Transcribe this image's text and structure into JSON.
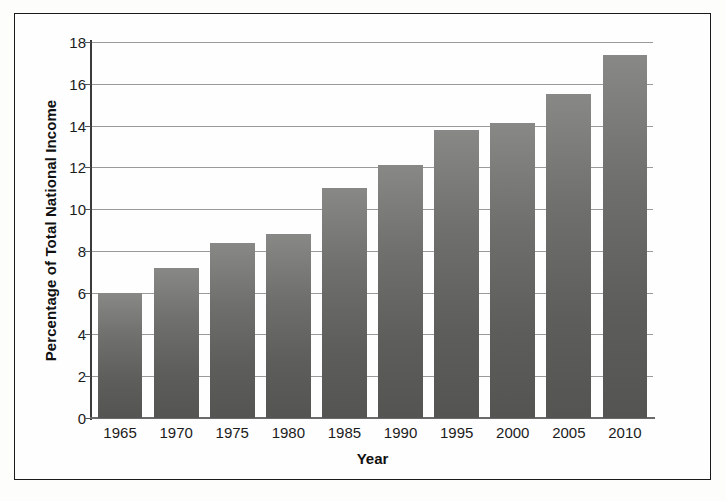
{
  "chart_data": {
    "type": "bar",
    "title": "",
    "xlabel": "Year",
    "ylabel": "Percentage of Total National Income",
    "categories": [
      "1965",
      "1970",
      "1975",
      "1980",
      "1985",
      "1990",
      "1995",
      "2000",
      "2005",
      "2010"
    ],
    "values": [
      6.0,
      7.2,
      8.4,
      8.8,
      11.0,
      12.1,
      13.8,
      14.1,
      15.5,
      17.4
    ],
    "ylim": [
      0,
      18
    ],
    "yticks": [
      0,
      2,
      4,
      6,
      8,
      10,
      12,
      14,
      16,
      18
    ],
    "ytick_labels": [
      "0",
      "2",
      "4",
      "6",
      "8",
      "10",
      "12",
      "14",
      "16",
      "18"
    ],
    "grid": true,
    "grid_axis": "y",
    "legend": "none",
    "bar_color": "#6b6b6a",
    "axis_color": "#3a3a3a",
    "grid_color": "#9a9a9a",
    "background": "#fefefe",
    "frame_color": "#1a1a1a"
  }
}
